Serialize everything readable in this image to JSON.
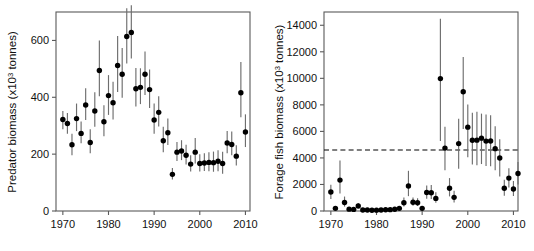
{
  "figure": {
    "panels": [
      "predator",
      "forage"
    ]
  },
  "chart_data": [
    {
      "id": "predator",
      "type": "scatter",
      "title": "",
      "xlabel": "",
      "ylabel_prefix": "Predator biomass (x10",
      "ylabel_sup": "3",
      "ylabel_suffix": " tonnes)",
      "ylabel_full": "Predator biomass (x10^3 tonnes)",
      "xlim": [
        1968.5,
        2011.0
      ],
      "ylim": [
        0,
        700
      ],
      "xticks": [
        1970,
        1980,
        1990,
        2000,
        2010
      ],
      "yticks": [
        0,
        200,
        400,
        600
      ],
      "grid": false,
      "legend": "none",
      "errorbars": true,
      "points": [
        {
          "x": 1970,
          "y": 322,
          "lo": 288,
          "hi": 352
        },
        {
          "x": 1971,
          "y": 308,
          "lo": 272,
          "hi": 345
        },
        {
          "x": 1972,
          "y": 233,
          "lo": 196,
          "hi": 272
        },
        {
          "x": 1973,
          "y": 325,
          "lo": 281,
          "hi": 378
        },
        {
          "x": 1974,
          "y": 273,
          "lo": 238,
          "hi": 315
        },
        {
          "x": 1975,
          "y": 373,
          "lo": 320,
          "hi": 432
        },
        {
          "x": 1976,
          "y": 241,
          "lo": 203,
          "hi": 288
        },
        {
          "x": 1977,
          "y": 352,
          "lo": 296,
          "hi": 418
        },
        {
          "x": 1978,
          "y": 494,
          "lo": 404,
          "hi": 600
        },
        {
          "x": 1979,
          "y": 314,
          "lo": 263,
          "hi": 372
        },
        {
          "x": 1980,
          "y": 406,
          "lo": 338,
          "hi": 478
        },
        {
          "x": 1981,
          "y": 381,
          "lo": 322,
          "hi": 455
        },
        {
          "x": 1982,
          "y": 512,
          "lo": 419,
          "hi": 616
        },
        {
          "x": 1983,
          "y": 481,
          "lo": 398,
          "hi": 573
        },
        {
          "x": 1984,
          "y": 614,
          "lo": 519,
          "hi": 713
        },
        {
          "x": 1985,
          "y": 628,
          "lo": 536,
          "hi": 724
        },
        {
          "x": 1986,
          "y": 430,
          "lo": 368,
          "hi": 503
        },
        {
          "x": 1987,
          "y": 435,
          "lo": 376,
          "hi": 502
        },
        {
          "x": 1988,
          "y": 481,
          "lo": 408,
          "hi": 561
        },
        {
          "x": 1989,
          "y": 427,
          "lo": 362,
          "hi": 498
        },
        {
          "x": 1990,
          "y": 320,
          "lo": 272,
          "hi": 378
        },
        {
          "x": 1991,
          "y": 347,
          "lo": 297,
          "hi": 404
        },
        {
          "x": 1992,
          "y": 247,
          "lo": 207,
          "hi": 296
        },
        {
          "x": 1993,
          "y": 275,
          "lo": 232,
          "hi": 325
        },
        {
          "x": 1994,
          "y": 129,
          "lo": 111,
          "hi": 151
        },
        {
          "x": 1995,
          "y": 207,
          "lo": 176,
          "hi": 243
        },
        {
          "x": 1996,
          "y": 211,
          "lo": 179,
          "hi": 249
        },
        {
          "x": 1997,
          "y": 196,
          "lo": 164,
          "hi": 233
        },
        {
          "x": 1998,
          "y": 165,
          "lo": 139,
          "hi": 196
        },
        {
          "x": 1999,
          "y": 207,
          "lo": 167,
          "hi": 257
        },
        {
          "x": 2000,
          "y": 167,
          "lo": 139,
          "hi": 200
        },
        {
          "x": 2001,
          "y": 169,
          "lo": 141,
          "hi": 203
        },
        {
          "x": 2002,
          "y": 171,
          "lo": 140,
          "hi": 207
        },
        {
          "x": 2003,
          "y": 170,
          "lo": 138,
          "hi": 209
        },
        {
          "x": 2004,
          "y": 175,
          "lo": 140,
          "hi": 214
        },
        {
          "x": 2005,
          "y": 167,
          "lo": 131,
          "hi": 208
        },
        {
          "x": 2006,
          "y": 239,
          "lo": 203,
          "hi": 281
        },
        {
          "x": 2007,
          "y": 234,
          "lo": 196,
          "hi": 280
        },
        {
          "x": 2008,
          "y": 193,
          "lo": 160,
          "hi": 231
        },
        {
          "x": 2009,
          "y": 416,
          "lo": 330,
          "hi": 524
        },
        {
          "x": 2010,
          "y": 278,
          "lo": 225,
          "hi": 340
        }
      ]
    },
    {
      "id": "forage",
      "type": "scatter",
      "title": "",
      "xlabel": "",
      "ylabel_prefix": "Forage fish biomass (x10",
      "ylabel_sup": "3",
      "ylabel_suffix": " tonnes)",
      "ylabel_full": "Forage fish biomass (x10^3 tonnes)",
      "xlim": [
        1968.5,
        2011.0
      ],
      "ylim": [
        0,
        15000
      ],
      "xticks": [
        1970,
        1980,
        1990,
        2000,
        2010
      ],
      "yticks": [
        0,
        2000,
        4000,
        6000,
        8000,
        10000,
        12000,
        14000
      ],
      "grid": false,
      "legend": "none",
      "errorbars": true,
      "reference_line": {
        "value": 4600,
        "style": "dashed"
      },
      "points": [
        {
          "x": 1970,
          "y": 1430,
          "lo": 900,
          "hi": 1980
        },
        {
          "x": 1971,
          "y": 200,
          "lo": 120,
          "hi": 300
        },
        {
          "x": 1972,
          "y": 2330,
          "lo": 1320,
          "hi": 3800
        },
        {
          "x": 1973,
          "y": 640,
          "lo": 330,
          "hi": 1090
        },
        {
          "x": 1974,
          "y": 140,
          "lo": 70,
          "hi": 240
        },
        {
          "x": 1975,
          "y": 120,
          "lo": 60,
          "hi": 210
        },
        {
          "x": 1976,
          "y": 380,
          "lo": 220,
          "hi": 610
        },
        {
          "x": 1977,
          "y": 80,
          "lo": 40,
          "hi": 150
        },
        {
          "x": 1978,
          "y": 70,
          "lo": 35,
          "hi": 130
        },
        {
          "x": 1979,
          "y": 60,
          "lo": 30,
          "hi": 120
        },
        {
          "x": 1980,
          "y": 65,
          "lo": 30,
          "hi": 125
        },
        {
          "x": 1981,
          "y": 80,
          "lo": 40,
          "hi": 150
        },
        {
          "x": 1982,
          "y": 95,
          "lo": 50,
          "hi": 170
        },
        {
          "x": 1983,
          "y": 100,
          "lo": 50,
          "hi": 180
        },
        {
          "x": 1984,
          "y": 130,
          "lo": 70,
          "hi": 220
        },
        {
          "x": 1985,
          "y": 200,
          "lo": 110,
          "hi": 330
        },
        {
          "x": 1986,
          "y": 620,
          "lo": 330,
          "hi": 1020
        },
        {
          "x": 1987,
          "y": 1890,
          "lo": 1120,
          "hi": 3030
        },
        {
          "x": 1988,
          "y": 660,
          "lo": 400,
          "hi": 1020
        },
        {
          "x": 1989,
          "y": 620,
          "lo": 380,
          "hi": 960
        },
        {
          "x": 1990,
          "y": 200,
          "lo": 110,
          "hi": 340
        },
        {
          "x": 1991,
          "y": 1390,
          "lo": 930,
          "hi": 1930
        },
        {
          "x": 1992,
          "y": 1380,
          "lo": 900,
          "hi": 1960
        },
        {
          "x": 1993,
          "y": 950,
          "lo": 620,
          "hi": 1420
        },
        {
          "x": 1994,
          "y": 9980,
          "lo": 5280,
          "hi": 14500
        },
        {
          "x": 1995,
          "y": 4740,
          "lo": 3070,
          "hi": 6350
        },
        {
          "x": 1996,
          "y": 1720,
          "lo": 1100,
          "hi": 2480
        },
        {
          "x": 1997,
          "y": 1030,
          "lo": 640,
          "hi": 1520
        },
        {
          "x": 1998,
          "y": 5080,
          "lo": 3180,
          "hi": 6960
        },
        {
          "x": 1999,
          "y": 8990,
          "lo": 6180,
          "hi": 11600
        },
        {
          "x": 2000,
          "y": 6320,
          "lo": 4060,
          "hi": 8030
        },
        {
          "x": 2001,
          "y": 5330,
          "lo": 3500,
          "hi": 7410
        },
        {
          "x": 2002,
          "y": 5340,
          "lo": 3440,
          "hi": 7480
        },
        {
          "x": 2003,
          "y": 5490,
          "lo": 3540,
          "hi": 7340
        },
        {
          "x": 2004,
          "y": 5270,
          "lo": 3400,
          "hi": 7280
        },
        {
          "x": 2005,
          "y": 5280,
          "lo": 3380,
          "hi": 7220
        },
        {
          "x": 2006,
          "y": 4700,
          "lo": 3080,
          "hi": 6390
        },
        {
          "x": 2007,
          "y": 4000,
          "lo": 2600,
          "hi": 5400
        },
        {
          "x": 2008,
          "y": 1720,
          "lo": 1150,
          "hi": 2360
        },
        {
          "x": 2009,
          "y": 2480,
          "lo": 1780,
          "hi": 3220
        },
        {
          "x": 2010,
          "y": 1660,
          "lo": 1130,
          "hi": 2260
        },
        {
          "x": 2011,
          "y": 2830,
          "lo": 2000,
          "hi": 3690
        }
      ]
    }
  ]
}
